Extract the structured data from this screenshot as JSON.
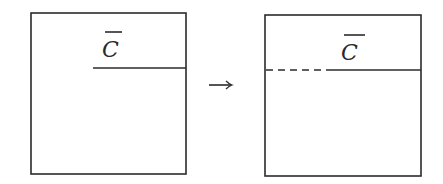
{
  "diagram": {
    "left_panel": {
      "label": "C",
      "label_overbar": true,
      "box": {
        "x": 31,
        "y": 13,
        "w": 155,
        "h": 161
      },
      "divider": {
        "type": "solid",
        "x1": 93,
        "x2": 186,
        "y": 68
      }
    },
    "arrow": {
      "symbol": "→",
      "x1": 209,
      "x2": 232,
      "y": 85
    },
    "right_panel": {
      "label": "C",
      "label_overbar": true,
      "box": {
        "x": 265,
        "y": 15,
        "w": 156,
        "h": 161
      },
      "divider_dashed": {
        "type": "dashed",
        "x1": 266,
        "x2": 324,
        "y": 70
      },
      "divider_solid": {
        "type": "solid",
        "x1": 326,
        "x2": 421,
        "y": 70
      }
    },
    "colors": {
      "stroke": "#2b2b2b",
      "background": "#ffffff"
    }
  }
}
